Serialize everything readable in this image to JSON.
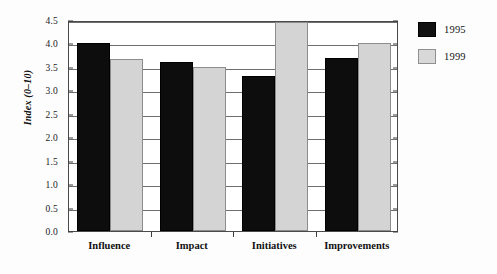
{
  "chart_data": {
    "type": "bar",
    "title": "",
    "subtitle": "",
    "xlabel": "",
    "ylabel": "Index (0–10)",
    "categories": [
      "Influence",
      "Impact",
      "Initiatives",
      "Improvements"
    ],
    "series": [
      {
        "name": "1995",
        "color": "#111111",
        "values": [
          4.0,
          3.6,
          3.3,
          3.7
        ]
      },
      {
        "name": "1999",
        "color": "#d8d8d8",
        "values": [
          3.67,
          3.5,
          4.45,
          4.0
        ]
      }
    ],
    "ylim": [
      0.0,
      4.5
    ],
    "ytick_step": 0.5,
    "ytick_labels": [
      "0.0",
      "0.5",
      "1.0",
      "1.5",
      "2.0",
      "2.5",
      "3.0",
      "3.5",
      "4.0",
      "4.5"
    ],
    "ytick_values": [
      0.0,
      0.5,
      1.0,
      1.5,
      2.0,
      2.5,
      3.0,
      3.5,
      4.0,
      4.5
    ],
    "grid": true,
    "grid_axis": "y",
    "legend": {
      "position": "right",
      "entries": [
        {
          "label": "1995",
          "color": "#111111"
        },
        {
          "label": "1999",
          "color": "#d8d8d8"
        }
      ]
    }
  }
}
